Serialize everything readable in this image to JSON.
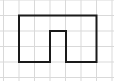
{
  "diagram": {
    "type": "grid-figure",
    "grid": {
      "columns": 7,
      "rows": 5,
      "cell_size": 15.5,
      "origin_x": 3.5,
      "origin_y": 0,
      "line_color": "#d9d9d9"
    },
    "shape": {
      "description": "Rectilinear polygon (arch / U-shape with rectangular notch at bottom center)",
      "stroke_color": "#1a1a1a",
      "stroke_width": 2,
      "vertices_grid": [
        [
          1,
          1
        ],
        [
          6,
          1
        ],
        [
          6,
          4
        ],
        [
          4,
          4
        ],
        [
          4,
          2
        ],
        [
          3,
          2
        ],
        [
          3,
          4
        ],
        [
          1,
          4
        ]
      ],
      "points": "19,15.5 96.5,15.5 96.5,62 66,62 66,31 50,31 50,62 19,62"
    }
  }
}
